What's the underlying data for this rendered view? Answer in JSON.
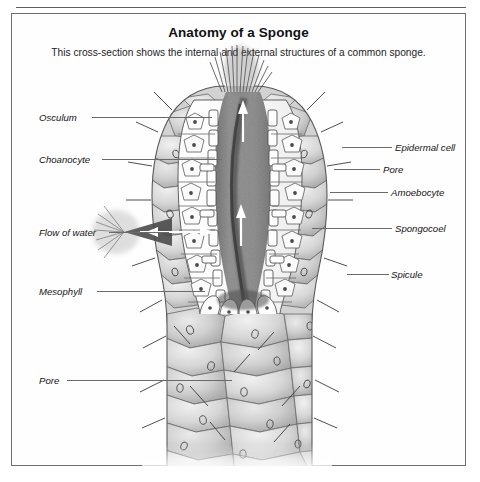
{
  "figure": {
    "title": "Anatomy of a Sponge",
    "subtitle": "This cross-section shows the internal and external structures of a common sponge."
  },
  "labels": {
    "left": [
      {
        "text": "Osculum",
        "y": 103,
        "text_x": 27,
        "line_x": 80,
        "line_w": 120
      },
      {
        "text": "Choanocyte",
        "y": 145,
        "text_x": 27,
        "line_x": 90,
        "line_w": 120
      },
      {
        "text": "Flow of water",
        "y": 218,
        "text_x": 27,
        "line_x": 97,
        "line_w": 60
      },
      {
        "text": "Mesophyll",
        "y": 277,
        "text_x": 27,
        "line_x": 85,
        "line_w": 108
      },
      {
        "text": "Pore",
        "y": 366,
        "text_x": 27,
        "line_x": 55,
        "line_w": 165
      }
    ],
    "right": [
      {
        "text": "Epidermal cell",
        "y": 133,
        "text_x": 383,
        "line_x": 330,
        "line_w": 50
      },
      {
        "text": "Pore",
        "y": 155,
        "text_x": 371,
        "line_x": 322,
        "line_w": 46
      },
      {
        "text": "Amoebocyte",
        "y": 178,
        "text_x": 379,
        "line_x": 318,
        "line_w": 58
      },
      {
        "text": "Spongocoel",
        "y": 214,
        "text_x": 383,
        "line_x": 300,
        "line_w": 80
      },
      {
        "text": "Spicule",
        "y": 260,
        "text_x": 379,
        "line_x": 335,
        "line_w": 42
      }
    ]
  },
  "colors": {
    "frame_border": "#6d6d6d",
    "rule": "#5e5e5e",
    "leader": "#6a6a6a",
    "spongocoel_fill": "#8a8a8a",
    "ectoderm_cell_fill": "#c9c9c9",
    "cell_outline": "#5d5d5d",
    "inner_cell_fill": "#fbfbfb",
    "spicule": "#4a4a4a",
    "text": "#151515"
  },
  "illustration": {
    "type": "scientific-cross-section",
    "subject": "sponge (Porifera) longitudinal cross-section",
    "structures": [
      "osculum",
      "spongocoel",
      "choanocyte layer",
      "mesophyll",
      "epidermal cells",
      "pores (ostia)",
      "amoebocytes",
      "spicules",
      "water flow arrows"
    ]
  }
}
